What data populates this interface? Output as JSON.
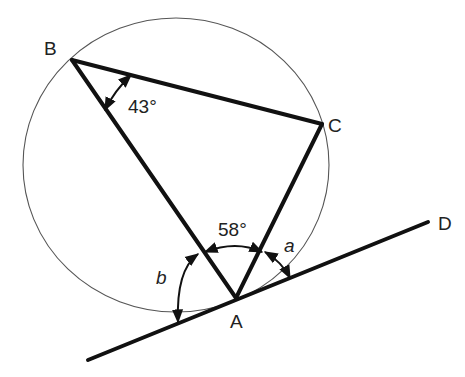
{
  "diagram": {
    "colors": {
      "stroke": "#111111",
      "circle": "#555555",
      "text": "#222222",
      "background": "#ffffff"
    },
    "circle": {
      "cx": 176,
      "cy": 165,
      "rx": 153,
      "ry": 147
    },
    "points": {
      "B": {
        "label": "B",
        "x": 72,
        "y": 60
      },
      "C": {
        "label": "C",
        "x": 322,
        "y": 124
      },
      "A": {
        "label": "A",
        "x": 236,
        "y": 298
      },
      "D": {
        "label": "D",
        "x": 428,
        "y": 222
      },
      "T": {
        "x": 88,
        "y": 360
      }
    },
    "labels": {
      "B": "B",
      "C": "C",
      "A": "A",
      "D": "D",
      "angle_B": "43°",
      "angle_A": "58°",
      "angle_a": "a",
      "angle_b": "b"
    },
    "segments": [
      "BC",
      "CA",
      "AB",
      "tangent TD"
    ]
  }
}
